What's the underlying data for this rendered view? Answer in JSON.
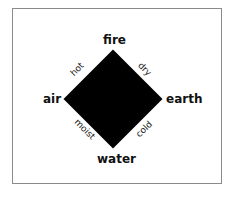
{
  "diagram": {
    "title": "",
    "shape": "diamond",
    "colors": {
      "diamond_fill": "#000000",
      "frame_border": "#8a8a8a",
      "background": "#ffffff",
      "text": "#111111"
    },
    "elements": {
      "top": "fire",
      "left": "air",
      "right": "earth",
      "bottom": "water"
    },
    "qualities": {
      "top_left": "hot",
      "top_right": "dry",
      "bottom_left": "moist",
      "bottom_right": "cold"
    }
  }
}
